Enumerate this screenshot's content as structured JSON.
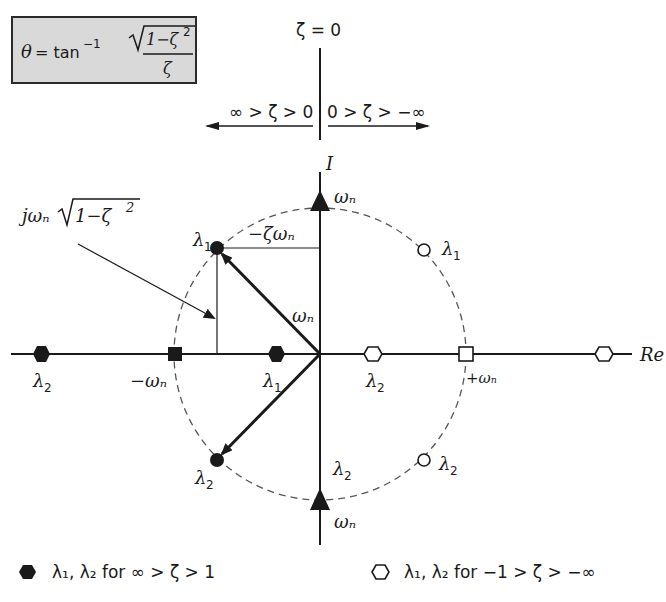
{
  "formula": {
    "lhs": "θ = tan",
    "exponent": "−1",
    "numerator": "1−ζ²",
    "numerator_base": "1−ζ",
    "numerator_power": "2",
    "denominator": "ζ",
    "full_text": "θ = tan⁻¹ √(1−ζ²) / ζ"
  },
  "zeta_axis": {
    "top_label": "ζ = 0",
    "left_range": "∞ > ζ > 0",
    "right_range": "0 > ζ > −∞"
  },
  "axes": {
    "imag_label": "I",
    "real_label": "Re"
  },
  "annotations": {
    "imag_component": "jωₙ√(1−ζ²)",
    "imag_component_prefix": "jωₙ",
    "imag_component_radicand": "1−ζ",
    "imag_component_power": "2",
    "real_component": "−ζωₙ",
    "vector_magnitude": "ωₙ"
  },
  "points": [
    {
      "id": "triangle-top",
      "label": "ωₙ",
      "marker": "filled-triangle"
    },
    {
      "id": "triangle-bottom",
      "label": "ωₙ",
      "marker": "filled-triangle"
    },
    {
      "id": "imag-axis-lambda2",
      "label": "λ₂"
    },
    {
      "id": "underdamped-lambda1",
      "label": "λ₁",
      "marker": "filled-circle"
    },
    {
      "id": "underdamped-lambda2",
      "label": "λ₂",
      "marker": "filled-circle"
    },
    {
      "id": "neg-underdamped-lambda1",
      "label": "λ₁",
      "marker": "open-circle"
    },
    {
      "id": "neg-underdamped-lambda2",
      "label": "λ₂",
      "marker": "open-circle"
    },
    {
      "id": "critical-neg",
      "label": "−ωₙ",
      "marker": "filled-square"
    },
    {
      "id": "critical-pos",
      "label": "+ωₙ",
      "marker": "open-square"
    },
    {
      "id": "overdamped-lambda2",
      "label": "λ₂",
      "marker": "filled-hexagon"
    },
    {
      "id": "overdamped-lambda1",
      "label": "λ₁",
      "marker": "filled-hexagon"
    },
    {
      "id": "neg-overdamped-lambda2",
      "label": "λ₂",
      "marker": "open-hexagon"
    },
    {
      "id": "neg-overdamped-far",
      "label": "",
      "marker": "open-hexagon"
    }
  ],
  "labels": {
    "omega_n": "ωₙ",
    "neg_omega_n": "−ωₙ",
    "pos_omega_n": "+ωₙ",
    "lambda1": "λ",
    "lambda2": "λ",
    "sub1": "1",
    "sub2": "2",
    "minus_zeta_omega": "−ζωₙ"
  },
  "legend": [
    {
      "marker": "filled-hexagon",
      "text": "λ₁, λ₂ for ∞ > ζ > 1"
    },
    {
      "marker": "open-hexagon",
      "text": "λ₁, λ₂ for −1 > ζ > −∞"
    }
  ],
  "colors": {
    "ink": "#1a1a1a",
    "box_fill": "#d9d9d9",
    "dashed_circle": "#555555"
  }
}
